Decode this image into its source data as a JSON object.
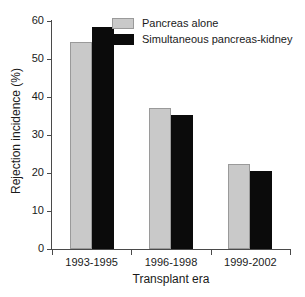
{
  "chart_data": {
    "type": "bar",
    "title": "",
    "xlabel": "Transplant era",
    "ylabel": "Rejection incidence (%)",
    "categories": [
      "1993-1995",
      "1996-1998",
      "1999-2002"
    ],
    "series": [
      {
        "name": "Pancreas alone",
        "color": "#c9c9c9",
        "values": [
          54.5,
          37.2,
          22.5
        ]
      },
      {
        "name": "Simultaneous pancreas-kidney",
        "color": "#0b0b0b",
        "values": [
          58.4,
          35.3,
          20.5
        ]
      }
    ],
    "ylim": [
      0,
      60
    ],
    "yticks": [
      0,
      10,
      20,
      30,
      40,
      50,
      60
    ],
    "ytick_labels": [
      "0",
      "10",
      "20",
      "30",
      "40",
      "50",
      "60"
    ],
    "grid": false,
    "legend_position": "top-center"
  },
  "legend": {
    "entries": [
      {
        "label": "Pancreas alone",
        "swatch": "gray-swatch-icon"
      },
      {
        "label": "Simultaneous pancreas-kidney",
        "swatch": "black-swatch-icon"
      }
    ]
  }
}
